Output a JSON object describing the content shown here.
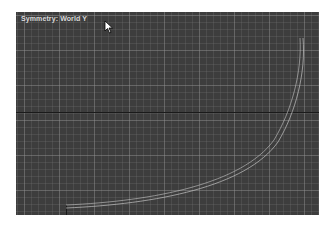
{
  "viewport": {
    "label": "Symmetry: World Y",
    "background_color": "#3d3d3d",
    "grid_color": "#8a8a8a",
    "curve_color": "#c8c8c8",
    "axis_color": "#1a1a1a"
  },
  "cursor": {
    "icon": "arrow-pointer-icon"
  }
}
